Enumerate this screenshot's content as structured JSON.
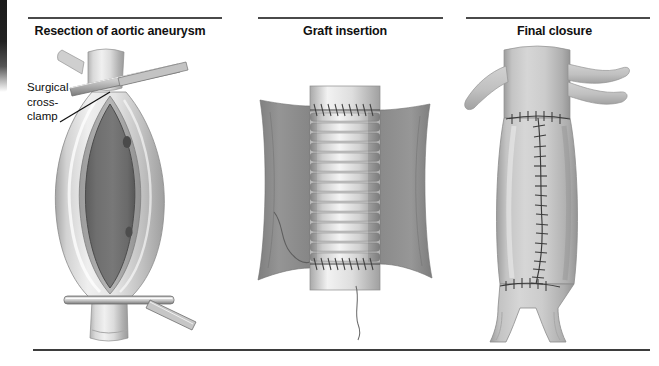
{
  "figure": {
    "panels": [
      {
        "id": "resection",
        "title": "Resection of aortic aneurysm",
        "callout": {
          "line1": "Surgical",
          "line2": "cross-",
          "line3": "clamp",
          "target": "surgical-cross-clamp"
        },
        "elements": [
          "aorta-proximal-neck",
          "aneurysm-sac-opened",
          "aneurysm-lumen",
          "surgical-cross-clamp-proximal",
          "surgical-cross-clamp-distal",
          "lumbar-ostia"
        ]
      },
      {
        "id": "graft",
        "title": "Graft insertion",
        "elements": [
          "corrugated-dacron-graft",
          "proximal-anastomosis-suture",
          "distal-anastomosis-suture",
          "aneurysm-sac-flap-left",
          "aneurysm-sac-flap-right",
          "suture-tail"
        ],
        "graft_rings": 15
      },
      {
        "id": "closure",
        "title": "Final closure",
        "elements": [
          "aorta-proximal",
          "renal-artery-left",
          "renal-artery-right-upper",
          "renal-artery-right-lower",
          "sac-closure-suture-line",
          "proximal-transverse-suture",
          "distal-transverse-suture",
          "aortic-bifurcation",
          "iliac-artery-left",
          "iliac-artery-right"
        ],
        "suture_stitches": 18
      }
    ],
    "colors": {
      "background": "#ffffff",
      "rule": "#4a4a4a",
      "bottom_rule": "#3d3d3d",
      "title_text": "#111111",
      "callout_text": "#0d0d0d",
      "vessel_wall_light": "#d8d8d8",
      "vessel_wall_mid": "#bcbcbc",
      "vessel_shadow": "#9a9a9a",
      "lumen_dark": "#6e6e6e",
      "lumen_darker": "#5b5b5b",
      "sac_flap": "#8e8e8e",
      "graft_ring_light": "#e2e2e2",
      "graft_ring_dark": "#9d9d9d",
      "clamp_metal": "#cfcfcf",
      "clamp_metal_edge": "#707070",
      "suture_line": "#3a3a3a",
      "scan_edge": "#1a1a1a"
    }
  }
}
